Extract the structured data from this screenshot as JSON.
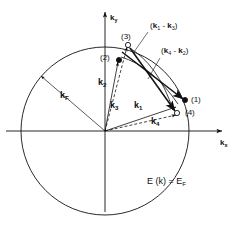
{
  "figure": {
    "name": "fermi-sphere-scattering-diagram",
    "background_color": "#ffffff",
    "line_color": "#111111"
  },
  "axes": {
    "y_label": "k",
    "y_subscript": "y",
    "x_label": "k",
    "x_subscript": "x",
    "origin": {
      "x": 105,
      "y": 131
    }
  },
  "fermi_surface": {
    "radius_label": "k",
    "radius_subscript": "F",
    "equation_text": "E (k) = E",
    "equation_subscript": "F",
    "center": {
      "x": 105,
      "y": 131
    },
    "radius_px": 84
  },
  "vectors": [
    {
      "name": "k1",
      "label": "k",
      "subscript": "1",
      "label_x": 134,
      "label_y": 101
    },
    {
      "name": "k2",
      "label": "k",
      "subscript": "2",
      "label_x": 98,
      "label_y": 78
    },
    {
      "name": "k3",
      "label": "k",
      "subscript": "3",
      "label_x": 110,
      "label_y": 101
    },
    {
      "name": "k4",
      "label": "k",
      "subscript": "4",
      "label_x": 151,
      "label_y": 117
    },
    {
      "name": "kF",
      "label": "k",
      "subscript": "F",
      "label_x": 60,
      "label_y": 91
    }
  ],
  "state_points": [
    {
      "name": "point-1",
      "label": "(1)",
      "marker": "filled",
      "cx": 185,
      "cy": 100,
      "label_x": 191,
      "label_y": 96
    },
    {
      "name": "point-2",
      "label": "(2)",
      "marker": "filled",
      "cx": 119,
      "cy": 60,
      "label_x": 100,
      "label_y": 54
    },
    {
      "name": "point-3",
      "label": "(3)",
      "marker": "open",
      "cx": 128,
      "cy": 45,
      "label_x": 121,
      "label_y": 34
    },
    {
      "name": "point-4",
      "label": "(4)",
      "marker": "open",
      "cx": 177,
      "cy": 113,
      "label_x": 185,
      "label_y": 109
    }
  ],
  "momentum_transfers": [
    {
      "name": "momentum-transfer-1-3",
      "open": "(",
      "head": "k",
      "head_sub": "1",
      "minus": " - ",
      "tail": "k",
      "tail_sub": "3",
      "close": ")",
      "label_x": 150,
      "label_y": 23
    },
    {
      "name": "momentum-transfer-4-2",
      "open": "(",
      "head": "k",
      "head_sub": "4",
      "minus": " - ",
      "tail": "k",
      "tail_sub": "2",
      "close": ")",
      "label_x": 161,
      "label_y": 48
    }
  ]
}
